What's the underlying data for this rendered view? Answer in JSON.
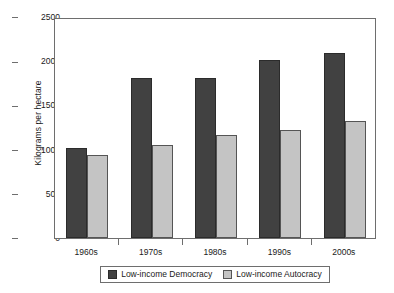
{
  "chart_data": {
    "type": "bar",
    "title": "",
    "subtitle": "",
    "xlabel": "",
    "ylabel": "Kilograms per hectare",
    "categories": [
      "1960s",
      "1970s",
      "1980s",
      "1990s",
      "2000s"
    ],
    "series": [
      {
        "name": "Low-income Democracy",
        "color": "#414141",
        "values": [
          1020,
          1815,
          1815,
          2010,
          2095
        ]
      },
      {
        "name": "Low-income Autocracy",
        "color": "#c4c4c4",
        "values": [
          940,
          1050,
          1165,
          1220,
          1325
        ]
      }
    ],
    "ylim": [
      0,
      2500
    ],
    "yticks": [
      0,
      500,
      1000,
      1500,
      2000,
      2500
    ],
    "ytick_labels": [
      "0",
      "500",
      "1000",
      "1500",
      "2000",
      "2500"
    ],
    "grid": false,
    "legend_position": "bottom",
    "frame": true
  }
}
